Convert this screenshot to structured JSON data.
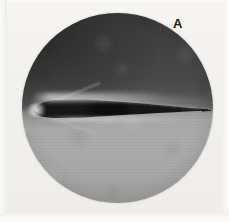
{
  "figure": {
    "label": "A",
    "caption": "",
    "kind": "schlieren-photograph",
    "window": {
      "shape": "circle",
      "center_x": 117,
      "center_y": 108,
      "diameter": 191
    },
    "colors": {
      "background": "#f2f1ee",
      "upper_field": "#434343",
      "lower_field": "#a9a9a9",
      "airfoil": "#121212",
      "highlight": "#ffffff",
      "label": "#1d1d1d"
    },
    "regions": [
      {
        "name": "upper-field",
        "description": "dark mottled compression region above the airfoil",
        "tone": "dark"
      },
      {
        "name": "lower-field",
        "description": "light mottled expansion region below the airfoil",
        "tone": "light"
      },
      {
        "name": "leading-edge-glow",
        "description": "bright luminous spot at the airfoil nose",
        "tone": "bright"
      },
      {
        "name": "upper-surface-streak",
        "description": "bright streak along the upper surface",
        "tone": "bright"
      }
    ],
    "airfoil_profile": {
      "leading_edge_x": 34,
      "trailing_edge_x": 207,
      "chord_px": 173,
      "max_thickness_px": 13,
      "max_thickness_x": 62,
      "description": "slender wedge-like section, blunt-ish nose tapering to a needle-sharp trailing edge"
    }
  }
}
